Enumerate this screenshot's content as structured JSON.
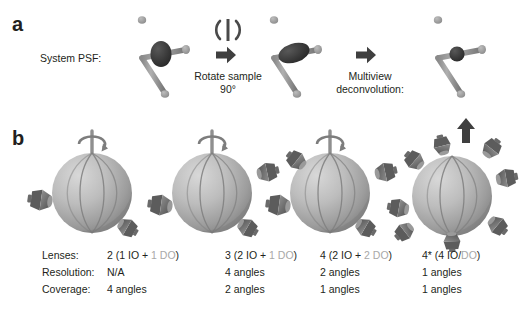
{
  "figure": {
    "panels": [
      {
        "letter": "a"
      },
      {
        "letter": "b"
      }
    ]
  },
  "panel_a": {
    "psf_label": "System PSF:",
    "step1_label_line1": "Rotate sample",
    "step1_label_line2": "90°",
    "step2_label_line1": "Multiview",
    "step2_label_line2": "deconvolution:",
    "icons": {
      "rotation": "rotation-symbol-icon",
      "arrow_right_1": "arrow-right-icon",
      "arrow_right_2": "arrow-right-icon",
      "arrow_up": "arrow-up-icon"
    },
    "psf_stages": [
      {
        "name": "psf-original",
        "blob": "elongated-vertical"
      },
      {
        "name": "psf-rotated",
        "blob": "elongated-diagonal"
      },
      {
        "name": "psf-deconvolved",
        "blob": "compact-isotropic"
      }
    ]
  },
  "panel_b": {
    "row_labels": [
      "Lenses:",
      "Resolution:",
      "Coverage:"
    ],
    "columns": [
      {
        "lenses_prefix": "2 (1 IO + ",
        "lenses_dim": "1 DO",
        "lenses_suffix": ")",
        "resolution": "N/A",
        "coverage": "4 angles",
        "sphere_name": "sphere-config-1",
        "has_rotation_axis": true,
        "lens_count": 2
      },
      {
        "lenses_prefix": "3 (2 IO + ",
        "lenses_dim": "1 DO",
        "lenses_suffix": ")",
        "resolution": "4 angles",
        "coverage": "2 angles",
        "sphere_name": "sphere-config-2",
        "has_rotation_axis": true,
        "lens_count": 3
      },
      {
        "lenses_prefix": "4 (2 IO + ",
        "lenses_dim": "2 DO",
        "lenses_suffix": ")",
        "resolution": "2 angles",
        "coverage": "1 angles",
        "sphere_name": "sphere-config-3",
        "has_rotation_axis": true,
        "lens_count": 4
      },
      {
        "lenses_prefix": "4* (4 IO/",
        "lenses_dim": "DO",
        "lenses_suffix": ")",
        "resolution": "1 angles",
        "coverage": "1 angles",
        "sphere_name": "sphere-config-4",
        "has_rotation_axis": false,
        "lens_count": 8
      }
    ]
  },
  "colors": {
    "text": "#231f20",
    "dim_text": "#a8a8a8",
    "sphere_light": "#c9c9c9",
    "sphere_mid": "#a6a6a6",
    "sphere_dark": "#7d7d7d",
    "lens_gray": "#6f6f6f",
    "axis_gray": "#9a9a9a",
    "blob_dark": "#3a3a3a",
    "arrow": "#3f3f3f",
    "background": "#ffffff"
  }
}
